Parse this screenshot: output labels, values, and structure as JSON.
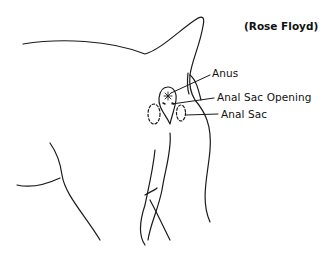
{
  "figure": {
    "credit": "(Rose Floyd)",
    "labels": {
      "anus": "Anus",
      "anal_sac_opening": "Anal Sac Opening",
      "anal_sac": "Anal Sac"
    },
    "line_color": "#1a1a1a",
    "background": "#ffffff"
  }
}
